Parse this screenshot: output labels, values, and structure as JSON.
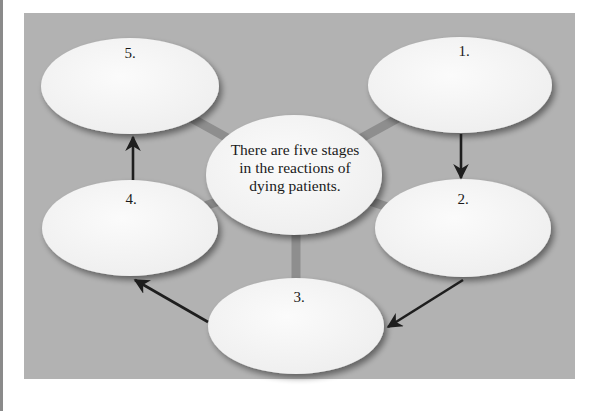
{
  "diagram": {
    "title": "Five stages in the reactions of dying patients",
    "center": {
      "text_lines": [
        "There are five stages",
        "in the reactions of",
        "dying patients."
      ]
    },
    "nodes": [
      {
        "id": "stage-1",
        "label": "1."
      },
      {
        "id": "stage-2",
        "label": "2."
      },
      {
        "id": "stage-3",
        "label": "3."
      },
      {
        "id": "stage-4",
        "label": "4."
      },
      {
        "id": "stage-5",
        "label": "5."
      }
    ],
    "edges": [
      {
        "from": "1",
        "to": "2"
      },
      {
        "from": "2",
        "to": "3"
      },
      {
        "from": "3",
        "to": "4"
      },
      {
        "from": "4",
        "to": "5"
      }
    ],
    "colors": {
      "panel": "#b2b2b2",
      "ellipse_fill": "#f4f4f4",
      "connector": "#8e8e8e",
      "arrow": "#1e1e1e"
    }
  }
}
